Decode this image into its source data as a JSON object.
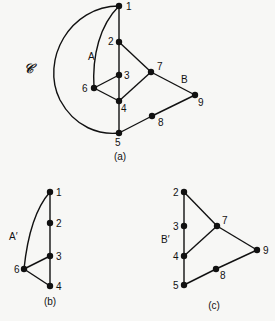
{
  "figure": {
    "curve_label": "𝒞",
    "panels": [
      {
        "id": "a",
        "caption": "(a)",
        "region_labels": [
          {
            "text": "A",
            "x": 88,
            "y": 60
          },
          {
            "text": "B",
            "x": 181,
            "y": 83
          }
        ],
        "nodes": [
          {
            "id": "1",
            "x": 119,
            "y": 6,
            "lx": 126,
            "ly": 10
          },
          {
            "id": "2",
            "x": 119,
            "y": 42,
            "lx": 108,
            "ly": 45
          },
          {
            "id": "3",
            "x": 119,
            "y": 75,
            "lx": 124,
            "ly": 79
          },
          {
            "id": "4",
            "x": 119,
            "y": 101,
            "lx": 121,
            "ly": 112
          },
          {
            "id": "5",
            "x": 119,
            "y": 133,
            "lx": 115,
            "ly": 146
          },
          {
            "id": "6",
            "x": 94,
            "y": 88,
            "lx": 82,
            "ly": 92
          },
          {
            "id": "7",
            "x": 151,
            "y": 72,
            "lx": 157,
            "ly": 70
          },
          {
            "id": "8",
            "x": 152,
            "y": 116,
            "lx": 158,
            "ly": 126
          },
          {
            "id": "9",
            "x": 195,
            "y": 95,
            "lx": 198,
            "ly": 106
          }
        ],
        "edges": [
          [
            "1",
            "2"
          ],
          [
            "2",
            "3"
          ],
          [
            "3",
            "4"
          ],
          [
            "4",
            "5"
          ],
          [
            "2",
            "7"
          ],
          [
            "7",
            "4"
          ],
          [
            "7",
            "9"
          ],
          [
            "9",
            "8"
          ],
          [
            "8",
            "5"
          ],
          [
            "6",
            "3"
          ],
          [
            "6",
            "4"
          ]
        ]
      },
      {
        "id": "b",
        "caption": "(b)",
        "region_labels": [
          {
            "text": "A′",
            "x": 9,
            "y": 240
          }
        ],
        "nodes": [
          {
            "id": "1",
            "x": 50,
            "y": 192,
            "lx": 56,
            "ly": 196
          },
          {
            "id": "2",
            "x": 50,
            "y": 223,
            "lx": 56,
            "ly": 227
          },
          {
            "id": "3",
            "x": 50,
            "y": 256,
            "lx": 56,
            "ly": 260
          },
          {
            "id": "4",
            "x": 50,
            "y": 286,
            "lx": 56,
            "ly": 290
          },
          {
            "id": "6",
            "x": 24,
            "y": 269,
            "lx": 14,
            "ly": 273
          }
        ],
        "edges": [
          [
            "1",
            "2"
          ],
          [
            "2",
            "3"
          ],
          [
            "3",
            "4"
          ],
          [
            "6",
            "3"
          ],
          [
            "6",
            "4"
          ]
        ]
      },
      {
        "id": "c",
        "caption": "(c)",
        "region_labels": [
          {
            "text": "B′",
            "x": 161,
            "y": 243
          }
        ],
        "nodes": [
          {
            "id": "2",
            "x": 184,
            "y": 192,
            "lx": 173,
            "ly": 196
          },
          {
            "id": "3",
            "x": 184,
            "y": 226,
            "lx": 173,
            "ly": 230
          },
          {
            "id": "4",
            "x": 184,
            "y": 256,
            "lx": 173,
            "ly": 260
          },
          {
            "id": "5",
            "x": 184,
            "y": 285,
            "lx": 173,
            "ly": 289
          },
          {
            "id": "7",
            "x": 217,
            "y": 226,
            "lx": 222,
            "ly": 224
          },
          {
            "id": "8",
            "x": 216,
            "y": 269,
            "lx": 220,
            "ly": 279
          },
          {
            "id": "9",
            "x": 257,
            "y": 250,
            "lx": 263,
            "ly": 254
          }
        ],
        "edges": [
          [
            "2",
            "3"
          ],
          [
            "3",
            "4"
          ],
          [
            "4",
            "5"
          ],
          [
            "2",
            "7"
          ],
          [
            "7",
            "4"
          ],
          [
            "7",
            "9"
          ],
          [
            "9",
            "8"
          ],
          [
            "8",
            "5"
          ]
        ]
      }
    ],
    "captions_pos": {
      "a": [
        120,
        160
      ],
      "b": [
        50,
        305
      ],
      "c": [
        214,
        309
      ]
    }
  }
}
